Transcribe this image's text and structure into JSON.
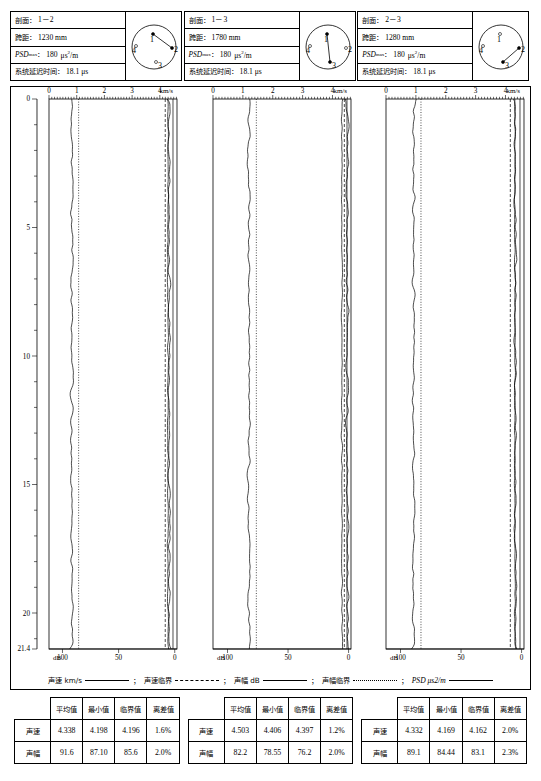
{
  "document": {
    "type": "sonic-logging-pile-integrity-report",
    "panel_count": 3
  },
  "panels": [
    {
      "id": "panel-1",
      "header": {
        "profile_label": "剖面：",
        "profile_value": "1－2",
        "span_label": "跨距：",
        "span_value": "1230 mm",
        "psd_label": "PSD",
        "psd_sub": "max",
        "psd_colon": "：",
        "psd_value": "180",
        "psd_unit_pre": "μs",
        "psd_unit_sup": "2",
        "psd_unit_post": "/m",
        "delay_label": "系统延迟时间：",
        "delay_value": "18.1 μs"
      },
      "diagram": {
        "name": "sensor-layout-1-2",
        "points": [
          "1",
          "2",
          "3",
          "4"
        ],
        "connection": [
          "1",
          "2"
        ]
      },
      "axes": {
        "top_unit": "km/s",
        "top_ticks": [
          "0",
          "1",
          "2",
          "3",
          "4"
        ],
        "bottom_unit": "dB",
        "bottom_ticks": [
          "100",
          "50",
          "0"
        ],
        "depth_ticks": [
          "0",
          "5",
          "10",
          "15",
          "20"
        ],
        "depth_max_label": "21.4",
        "depth_min": 0,
        "depth_max": 21.4
      },
      "stats": {
        "columns": [
          "平均值",
          "最小值",
          "临界值",
          "离差值"
        ],
        "rows": [
          {
            "name": "声速",
            "values": [
              "4.338",
              "4.198",
              "4.196",
              "1.6%"
            ]
          },
          {
            "name": "声幅",
            "values": [
              "91.6",
              "87.10",
              "85.6",
              "2.0%"
            ]
          }
        ]
      }
    },
    {
      "id": "panel-2",
      "header": {
        "profile_label": "剖面：",
        "profile_value": "1－3",
        "span_label": "跨距：",
        "span_value": "1780 mm",
        "psd_label": "PSD",
        "psd_sub": "max",
        "psd_colon": "：",
        "psd_value": "180",
        "psd_unit_pre": "μs",
        "psd_unit_sup": "2",
        "psd_unit_post": "/m",
        "delay_label": "系统延迟时间：",
        "delay_value": "18.1 μs"
      },
      "diagram": {
        "name": "sensor-layout-1-3",
        "points": [
          "1",
          "2",
          "3",
          "4"
        ],
        "connection": [
          "1",
          "3"
        ]
      },
      "axes": {
        "top_unit": "km/s",
        "top_ticks": [
          "0",
          "1",
          "2",
          "3",
          "4"
        ],
        "bottom_unit": "dB",
        "bottom_ticks": [
          "100",
          "50",
          "0"
        ],
        "depth_ticks": [
          "0",
          "5",
          "10",
          "15",
          "20"
        ],
        "depth_max_label": "21.4",
        "depth_min": 0,
        "depth_max": 21.4
      },
      "stats": {
        "columns": [
          "平均值",
          "最小值",
          "临界值",
          "离差值"
        ],
        "rows": [
          {
            "name": "声速",
            "values": [
              "4.503",
              "4.406",
              "4.397",
              "1.2%"
            ]
          },
          {
            "name": "声幅",
            "values": [
              "82.2",
              "78.55",
              "76.2",
              "2.0%"
            ]
          }
        ]
      }
    },
    {
      "id": "panel-3",
      "header": {
        "profile_label": "剖面：",
        "profile_value": "2－3",
        "span_label": "跨距：",
        "span_value": "1280 mm",
        "psd_label": "PSD",
        "psd_sub": "max",
        "psd_colon": "：",
        "psd_value": "180",
        "psd_unit_pre": "μs",
        "psd_unit_sup": "2",
        "psd_unit_post": "/m",
        "delay_label": "系统延迟时间：",
        "delay_value": "18.1 μs"
      },
      "diagram": {
        "name": "sensor-layout-2-3",
        "points": [
          "1",
          "2",
          "3",
          "4"
        ],
        "connection": [
          "2",
          "3"
        ]
      },
      "axes": {
        "top_unit": "km/s",
        "top_ticks": [
          "0",
          "1",
          "2",
          "3",
          "4"
        ],
        "bottom_unit": "dB",
        "bottom_ticks": [
          "100",
          "50",
          "0"
        ],
        "depth_ticks": [
          "0",
          "5",
          "10",
          "15",
          "20"
        ],
        "depth_max_label": "21.4",
        "depth_min": 0,
        "depth_max": 21.4
      },
      "stats": {
        "columns": [
          "平均值",
          "最小值",
          "临界值",
          "离差值"
        ],
        "rows": [
          {
            "name": "声速",
            "values": [
              "4.332",
              "4.169",
              "4.162",
              "2.0%"
            ]
          },
          {
            "name": "声幅",
            "values": [
              "89.1",
              "84.44",
              "83.1",
              "2.3%"
            ]
          }
        ]
      }
    }
  ],
  "legend": {
    "items": [
      {
        "label": "声速 km/s",
        "style": "solid",
        "italic": false
      },
      {
        "label": "声速临界",
        "style": "dashed",
        "italic": false
      },
      {
        "label": "声幅 dB",
        "style": "solid",
        "italic": false
      },
      {
        "label": "声幅临界",
        "style": "dotted",
        "italic": false
      },
      {
        "label": "PSD μs2/m",
        "style": "solid",
        "italic": true
      }
    ],
    "separator": "；"
  },
  "chart_data": {
    "type": "line",
    "xlabel": "km/s / dB",
    "ylabel": "深度 (m)",
    "ylim": [
      0,
      21.4
    ],
    "velocity_xlim": [
      0,
      4.6
    ],
    "amplitude_xlim": [
      110,
      0
    ],
    "grid": false,
    "legend_position": "bottom",
    "panels": [
      {
        "name": "1－2",
        "velocity_mean": 4.338,
        "velocity_min": 4.198,
        "velocity_critical": 4.196,
        "velocity_deviation_pct": 1.6,
        "amplitude_mean": 91.6,
        "amplitude_min": 87.1,
        "amplitude_critical": 85.6,
        "amplitude_deviation_pct": 2.0
      },
      {
        "name": "1－3",
        "velocity_mean": 4.503,
        "velocity_min": 4.406,
        "velocity_critical": 4.397,
        "velocity_deviation_pct": 1.2,
        "amplitude_mean": 82.2,
        "amplitude_min": 78.55,
        "amplitude_critical": 76.2,
        "amplitude_deviation_pct": 2.0
      },
      {
        "name": "2－3",
        "velocity_mean": 4.332,
        "velocity_min": 4.169,
        "velocity_critical": 4.162,
        "velocity_deviation_pct": 2.0,
        "amplitude_mean": 89.1,
        "amplitude_min": 84.44,
        "amplitude_critical": 83.1,
        "amplitude_deviation_pct": 2.3
      }
    ]
  }
}
